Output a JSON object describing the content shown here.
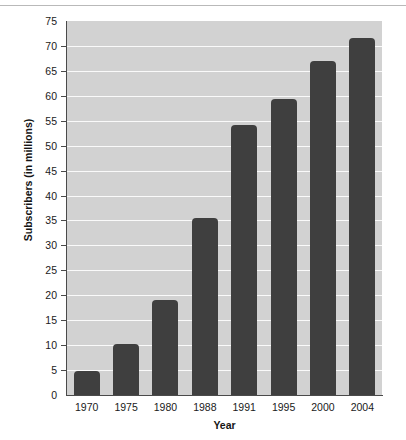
{
  "chart_data": {
    "type": "bar",
    "title": "",
    "xlabel": "Year",
    "ylabel": "Subscribers (in millions)",
    "categories": [
      "1970",
      "1975",
      "1980",
      "1988",
      "1991",
      "1995",
      "2000",
      "2004"
    ],
    "values": [
      4.8,
      10.2,
      19,
      35.5,
      54.2,
      59.3,
      67,
      71.5
    ],
    "ylim": [
      0,
      75
    ],
    "ytick_labels": [
      "0",
      "5",
      "10",
      "15",
      "20",
      "25",
      "30",
      "35",
      "40",
      "45",
      "50",
      "55",
      "60",
      "65",
      "70",
      "75"
    ],
    "ytick_values": [
      0,
      5,
      10,
      15,
      20,
      25,
      30,
      35,
      40,
      45,
      50,
      55,
      60,
      65,
      70,
      75
    ],
    "grid": true,
    "grid_axis": "y",
    "legend": null,
    "bar_color": "#3f3f3f",
    "plot_background": "#d2d2d2",
    "gridline_color": "#fafafa",
    "axis_color": "#4a4a4a",
    "figure_background": "#ffffff"
  }
}
